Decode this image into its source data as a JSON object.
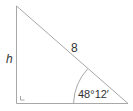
{
  "diagram": {
    "type": "right-triangle",
    "labels": {
      "height": "h",
      "hypotenuse": "8",
      "angle": "48°12′"
    },
    "colors": {
      "stroke": "#a8a8a8",
      "text": "#333333",
      "background": "#ffffff"
    }
  }
}
